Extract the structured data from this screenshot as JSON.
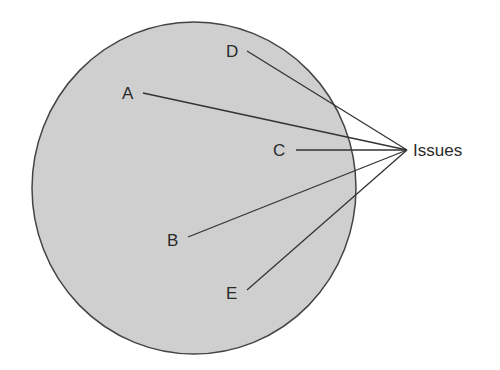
{
  "diagram": {
    "circle": {
      "cx": 194,
      "cy": 188,
      "rx": 162,
      "ry": 166,
      "fill": "#cfcfcf",
      "stroke": "#444444"
    },
    "target": {
      "label": "Issues",
      "x": 407,
      "y": 150
    },
    "points": [
      {
        "label": "A",
        "lx": 130,
        "ly": 93,
        "sx": 143,
        "sy": 93
      },
      {
        "label": "B",
        "lx": 175,
        "ly": 240,
        "sx": 188,
        "sy": 237
      },
      {
        "label": "C",
        "lx": 281,
        "ly": 150,
        "sx": 296,
        "sy": 150
      },
      {
        "label": "D",
        "lx": 233,
        "ly": 51,
        "sx": 247,
        "sy": 51
      },
      {
        "label": "E",
        "lx": 233,
        "ly": 293,
        "sx": 247,
        "sy": 290
      }
    ]
  }
}
